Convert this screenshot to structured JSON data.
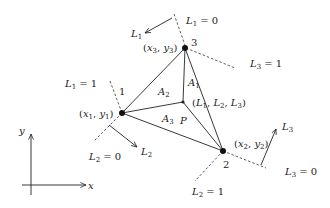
{
  "diagram": {
    "vertices": [
      {
        "id": "1",
        "label": "1",
        "coord_label_x": "x",
        "coord_label_x_sub": "1",
        "coord_label_y": "y",
        "coord_label_y_sub": "1",
        "px": 122,
        "py": 113
      },
      {
        "id": "2",
        "label": "2",
        "coord_label_x": "x",
        "coord_label_x_sub": "2",
        "coord_label_y": "y",
        "coord_label_y_sub": "2",
        "px": 223,
        "py": 151
      },
      {
        "id": "3",
        "label": "3",
        "coord_label_x": "x",
        "coord_label_x_sub": "3",
        "coord_label_y": "y",
        "coord_label_y_sub": "3",
        "px": 185,
        "py": 48
      }
    ],
    "point_p": {
      "label": "P",
      "coords": "(L1, L2, L3)",
      "L": "L",
      "s1": "1",
      "s2": "2",
      "s3": "3"
    },
    "areas": [
      {
        "name": "A",
        "sub": "1"
      },
      {
        "name": "A",
        "sub": "2"
      },
      {
        "name": "A",
        "sub": "3"
      }
    ],
    "level_lines": [
      {
        "var": "L",
        "sub": "1",
        "value_zero": "0",
        "value_one": "1"
      },
      {
        "var": "L",
        "sub": "2",
        "value_zero": "0",
        "value_one": "1"
      },
      {
        "var": "L",
        "sub": "3",
        "value_zero": "0",
        "value_one": "1"
      }
    ],
    "eq": " = ",
    "axes": {
      "x_label": "x",
      "y_label": "y"
    },
    "colors": {
      "stroke": "#222222",
      "background": "#ffffff"
    }
  }
}
